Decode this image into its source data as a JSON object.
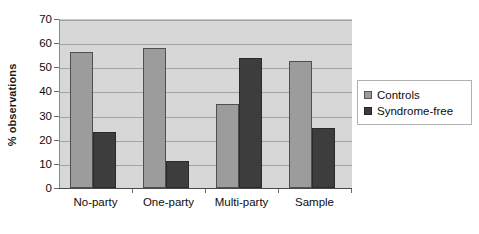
{
  "chart_data": {
    "type": "bar",
    "title": "",
    "subtitle": "",
    "xlabel": "",
    "ylabel": "% observations",
    "ylim": [
      0,
      70
    ],
    "yticks": [
      0,
      10,
      20,
      30,
      40,
      50,
      60,
      70
    ],
    "ytick_labels": [
      "0",
      "10",
      "20",
      "30",
      "40",
      "50",
      "60",
      "70"
    ],
    "grid": true,
    "grid_orientation": "horizontal",
    "legend_position": "right",
    "categories": [
      "No-party",
      "One-party",
      "Multi-party",
      "Sample"
    ],
    "series": [
      {
        "name": "Controls",
        "color": "#9c9c9c",
        "values": [
          56.5,
          58.0,
          35.0,
          52.5
        ]
      },
      {
        "name": "Syndrome-free",
        "color": "#3d3d3d",
        "values": [
          23.3,
          11.2,
          54.0,
          25.0
        ]
      }
    ],
    "annotations": [],
    "plot_background": "#d7d7d7",
    "gridline_color": "#a3a3a3"
  },
  "legend": {
    "items": [
      {
        "label": "Controls",
        "swatch": "controls-swatch"
      },
      {
        "label": "Syndrome-free",
        "swatch": "syndrome-free-swatch"
      }
    ]
  }
}
